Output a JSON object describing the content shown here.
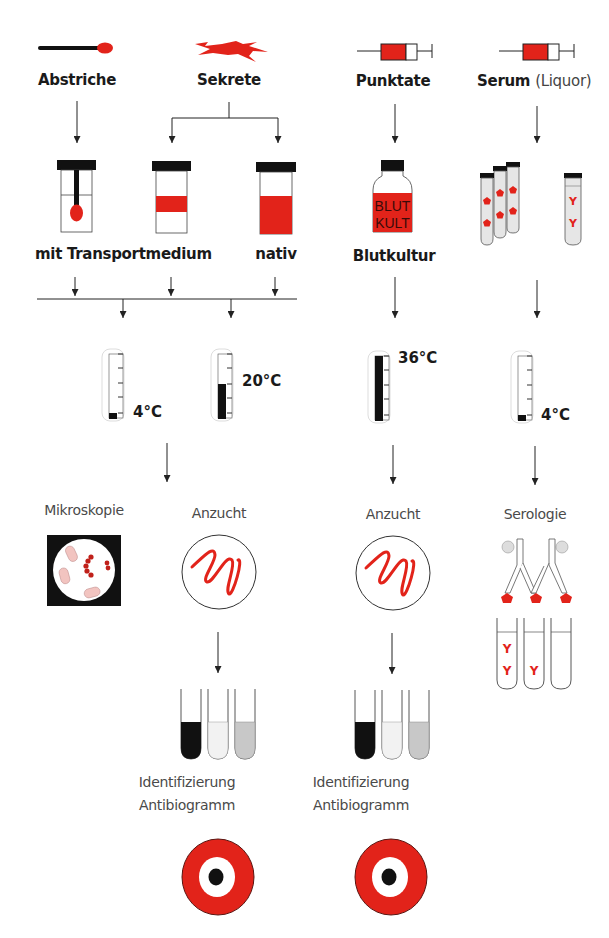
{
  "diagram": {
    "colors": {
      "red": "#e2231a",
      "black": "#111111",
      "pink": "#f2c4c0",
      "light_gray": "#e6e6e6",
      "mid_gray": "#c8c8c8",
      "line": "#222222"
    },
    "sources": {
      "abstriche": {
        "label": "Abstriche",
        "icon": "swab-icon"
      },
      "sekrete": {
        "label": "Sekrete",
        "icon": "secretion-splash-icon"
      },
      "punktate": {
        "label": "Punktate",
        "icon": "syringe-icon"
      },
      "serum": {
        "label": "Serum",
        "label_suffix": "(Liquor)",
        "icon": "syringe-icon"
      }
    },
    "containers": {
      "transport_label": "mit Transportmedium",
      "nativ_label": "nativ",
      "blutkultur_label": "Blutkultur",
      "bottle_text_line1": "BLUT",
      "bottle_text_line2": "KULT"
    },
    "temperatures": {
      "t1": "4°C",
      "t2": "20°C",
      "t3": "36°C",
      "t4": "4°C"
    },
    "methods": {
      "mikroskopie": "Mikroskopie",
      "anzucht_left": "Anzucht",
      "anzucht_right": "Anzucht",
      "serologie": "Serologie"
    },
    "results": {
      "left_line1": "Identifizierung",
      "left_line2": "Antibiogramm",
      "right_line1": "Identifizierung",
      "right_line2": "Antibiogramm"
    },
    "antibody_glyph": "Y"
  }
}
